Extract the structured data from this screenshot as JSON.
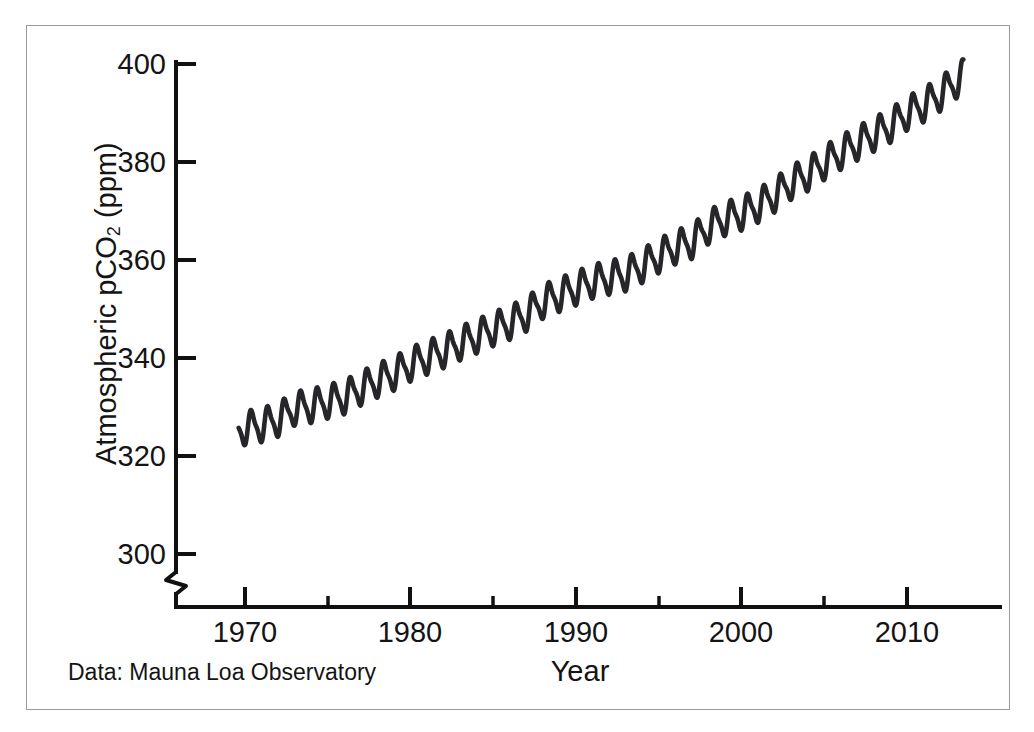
{
  "figure": {
    "source_caption": "Data: Mauna Loa Observatory",
    "artifact_text": " "
  },
  "chart_data": {
    "type": "line",
    "title": "",
    "subtitle": "",
    "xlabel": "Year",
    "ylabel": "Atmospheric pCO",
    "ylabel_sub": "2",
    "ylabel_unit": " (ppm)",
    "xlim": [
      1966.5,
      2013.5
    ],
    "ylim": [
      292,
      402
    ],
    "grid": false,
    "legend": null,
    "axis_break": true,
    "axis_break_note": "y-axis broken below 300 ppm",
    "line_color": "#26262a",
    "x_ticks_major": [
      "1970",
      "1980",
      "1990",
      "2000",
      "2010"
    ],
    "x_ticks_major_values": [
      1970,
      1980,
      1990,
      2000,
      2010
    ],
    "x_ticks_minor_values": [
      1975,
      1985,
      1995,
      2005
    ],
    "y_ticks_major": [
      "300",
      "320",
      "340",
      "360",
      "380",
      "400"
    ],
    "y_ticks_major_values": [
      300,
      320,
      340,
      360,
      380,
      400
    ],
    "annotations": [
      "Data: Mauna Loa Observatory"
    ],
    "series_description": "Monthly mean atmospheric CO2 concentration with seasonal sawtooth oscillation superimposed on a rising trend",
    "seasonal_amplitude_ppm": 6.2,
    "x": [
      1969.0,
      1970.0,
      1971.0,
      1972.0,
      1973.0,
      1974.0,
      1975.0,
      1976.0,
      1977.0,
      1978.0,
      1979.0,
      1980.0,
      1981.0,
      1982.0,
      1983.0,
      1984.0,
      1985.0,
      1986.0,
      1987.0,
      1988.0,
      1989.0,
      1990.0,
      1991.0,
      1992.0,
      1993.0,
      1994.0,
      1995.0,
      1996.0,
      1997.0,
      1998.0,
      1999.0,
      2000.0,
      2001.0,
      2002.0,
      2003.0,
      2004.0,
      2005.0,
      2006.0,
      2007.0,
      2008.0,
      2009.0,
      2010.0,
      2011.0,
      2012.0,
      2013.0
    ],
    "y": [
      324.6,
      325.7,
      326.3,
      327.4,
      329.7,
      330.2,
      331.1,
      332.0,
      333.8,
      335.4,
      336.8,
      338.7,
      340.1,
      341.4,
      343.0,
      344.4,
      345.9,
      347.2,
      348.9,
      351.5,
      352.9,
      354.2,
      355.6,
      356.4,
      357.1,
      358.8,
      360.8,
      362.6,
      363.7,
      366.7,
      368.4,
      369.5,
      371.1,
      373.2,
      375.8,
      377.5,
      379.8,
      381.9,
      383.8,
      385.6,
      387.4,
      389.9,
      391.6,
      393.8,
      396.5
    ]
  },
  "axes": {
    "y_title_full": "Atmospheric pCO2 (ppm)"
  }
}
